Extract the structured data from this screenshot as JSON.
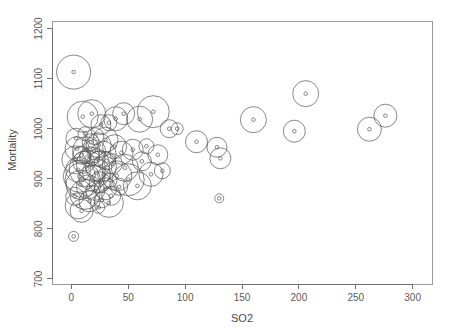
{
  "chart_data": {
    "type": "scatter",
    "title": "",
    "xlabel": "SO2",
    "ylabel": "Mortality",
    "xlim": [
      -17,
      317
    ],
    "ylim": [
      690,
      1215
    ],
    "xticks": [
      0,
      50,
      100,
      150,
      200,
      250,
      300
    ],
    "yticks": [
      700,
      800,
      900,
      1000,
      1100,
      1200
    ],
    "xtick_labels": [
      "0",
      "50",
      "100",
      "150",
      "200",
      "250",
      "300"
    ],
    "ytick_labels": [
      "700",
      "800",
      "900",
      "1000",
      "1100",
      "1200"
    ],
    "grid": false,
    "legend": "none",
    "encoding": "bubble size encodes a third variable (population / precipitation)",
    "marker": "open circle with small open circle at center",
    "points": [
      {
        "x": 2,
        "y": 1113,
        "r": 17.0
      },
      {
        "x": 10,
        "y": 1024,
        "r": 15.5
      },
      {
        "x": 18,
        "y": 1030,
        "r": 14.0
      },
      {
        "x": 26,
        "y": 1008,
        "r": 10.0
      },
      {
        "x": 33,
        "y": 1012,
        "r": 8.0
      },
      {
        "x": 39,
        "y": 1020,
        "r": 12.0
      },
      {
        "x": 46,
        "y": 1030,
        "r": 11.0
      },
      {
        "x": 60,
        "y": 1019,
        "r": 13.0
      },
      {
        "x": 72,
        "y": 1034,
        "r": 16.0
      },
      {
        "x": 86,
        "y": 1000,
        "r": 9.0
      },
      {
        "x": 93,
        "y": 1000,
        "r": 6.0
      },
      {
        "x": 110,
        "y": 974,
        "r": 11.0
      },
      {
        "x": 128,
        "y": 963,
        "r": 10.0
      },
      {
        "x": 131,
        "y": 941,
        "r": 10.5
      },
      {
        "x": 160,
        "y": 1018,
        "r": 13.0
      },
      {
        "x": 196,
        "y": 995,
        "r": 11.0
      },
      {
        "x": 206,
        "y": 1070,
        "r": 13.0
      },
      {
        "x": 262,
        "y": 999,
        "r": 12.0
      },
      {
        "x": 276,
        "y": 1026,
        "r": 11.5
      },
      {
        "x": 130,
        "y": 861,
        "r": 4.5
      },
      {
        "x": 2,
        "y": 785,
        "r": 5.0
      },
      {
        "x": 4,
        "y": 938,
        "r": 14.0
      },
      {
        "x": 5,
        "y": 960,
        "r": 12.0
      },
      {
        "x": 6,
        "y": 918,
        "r": 12.5
      },
      {
        "x": 7,
        "y": 905,
        "r": 16.0
      },
      {
        "x": 8,
        "y": 888,
        "r": 14.5
      },
      {
        "x": 9,
        "y": 947,
        "r": 9.0
      },
      {
        "x": 10,
        "y": 898,
        "r": 17.5
      },
      {
        "x": 11,
        "y": 933,
        "r": 11.0
      },
      {
        "x": 12,
        "y": 869,
        "r": 15.0
      },
      {
        "x": 13,
        "y": 957,
        "r": 13.5
      },
      {
        "x": 14,
        "y": 920,
        "r": 18.0
      },
      {
        "x": 15,
        "y": 884,
        "r": 12.0
      },
      {
        "x": 16,
        "y": 944,
        "r": 10.0
      },
      {
        "x": 17,
        "y": 973,
        "r": 8.5
      },
      {
        "x": 18,
        "y": 902,
        "r": 13.0
      },
      {
        "x": 19,
        "y": 929,
        "r": 16.5
      },
      {
        "x": 20,
        "y": 955,
        "r": 11.5
      },
      {
        "x": 21,
        "y": 876,
        "r": 9.5
      },
      {
        "x": 22,
        "y": 912,
        "r": 14.0
      },
      {
        "x": 23,
        "y": 940,
        "r": 7.5
      },
      {
        "x": 24,
        "y": 967,
        "r": 12.5
      },
      {
        "x": 25,
        "y": 893,
        "r": 10.5
      },
      {
        "x": 26,
        "y": 925,
        "r": 15.5
      },
      {
        "x": 27,
        "y": 858,
        "r": 8.0
      },
      {
        "x": 28,
        "y": 949,
        "r": 13.0
      },
      {
        "x": 29,
        "y": 908,
        "r": 6.5
      },
      {
        "x": 30,
        "y": 880,
        "r": 11.0
      },
      {
        "x": 31,
        "y": 936,
        "r": 9.0
      },
      {
        "x": 33,
        "y": 852,
        "r": 14.5
      },
      {
        "x": 34,
        "y": 897,
        "r": 7.0
      },
      {
        "x": 36,
        "y": 930,
        "r": 10.0
      },
      {
        "x": 38,
        "y": 964,
        "r": 12.0
      },
      {
        "x": 40,
        "y": 906,
        "r": 15.0
      },
      {
        "x": 42,
        "y": 884,
        "r": 8.5
      },
      {
        "x": 44,
        "y": 952,
        "r": 11.5
      },
      {
        "x": 47,
        "y": 922,
        "r": 13.5
      },
      {
        "x": 50,
        "y": 898,
        "r": 16.0
      },
      {
        "x": 54,
        "y": 958,
        "r": 10.5
      },
      {
        "x": 58,
        "y": 886,
        "r": 14.0
      },
      {
        "x": 62,
        "y": 935,
        "r": 9.5
      },
      {
        "x": 66,
        "y": 965,
        "r": 7.5
      },
      {
        "x": 70,
        "y": 909,
        "r": 12.0
      },
      {
        "x": 76,
        "y": 948,
        "r": 10.0
      },
      {
        "x": 80,
        "y": 916,
        "r": 8.0
      },
      {
        "x": 4,
        "y": 981,
        "r": 10.0
      },
      {
        "x": 6,
        "y": 846,
        "r": 13.0
      },
      {
        "x": 9,
        "y": 836,
        "r": 11.5
      },
      {
        "x": 3,
        "y": 865,
        "r": 9.0
      },
      {
        "x": 12,
        "y": 990,
        "r": 7.0
      },
      {
        "x": 16,
        "y": 855,
        "r": 10.5
      },
      {
        "x": 21,
        "y": 985,
        "r": 8.5
      },
      {
        "x": 24,
        "y": 843,
        "r": 6.0
      },
      {
        "x": 30,
        "y": 978,
        "r": 12.5
      },
      {
        "x": 35,
        "y": 866,
        "r": 9.5
      }
    ]
  },
  "axes": {
    "y_label": "Mortality",
    "x_label": "SO2"
  }
}
